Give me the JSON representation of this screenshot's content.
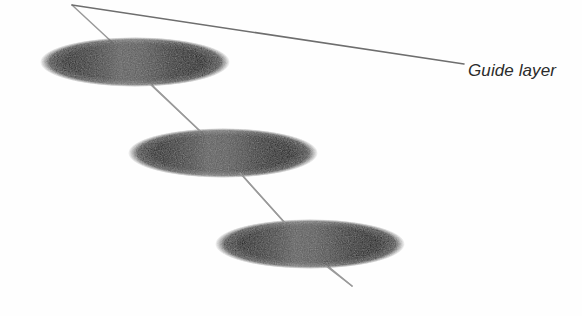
{
  "figure": {
    "title": "",
    "background_color": "#fefefe",
    "width": 582,
    "height": 316,
    "annotation": {
      "label": "Guide layer",
      "text_color": "#2b2b2b",
      "x": 468,
      "y": 62,
      "font_size": 17,
      "font_style": "italic"
    },
    "leader_line": {
      "name": "leader-line",
      "color": "#6e6e6e",
      "width": 1.6,
      "from_x": 72,
      "from_y": 5,
      "to_x": 464,
      "to_y": 64
    },
    "guide_path": {
      "name": "guide-path",
      "color": "#9a9a9a",
      "width": 1.5,
      "points": [
        [
          72,
          5
        ],
        [
          113,
          43
        ],
        [
          155,
          88
        ],
        [
          200,
          131
        ],
        [
          243,
          176
        ],
        [
          285,
          223
        ],
        [
          318,
          258
        ],
        [
          352,
          286
        ]
      ]
    },
    "ellipses": [
      {
        "name": "disc-top",
        "cx": 135,
        "cy": 62,
        "rx": 95,
        "ry": 25,
        "edge_color": "#0a0a0a",
        "center_color": "#5c5c5c",
        "highlight_stop": 0.42
      },
      {
        "name": "disc-middle",
        "cx": 223,
        "cy": 153,
        "rx": 95,
        "ry": 25,
        "edge_color": "#0a0a0a",
        "center_color": "#5c5c5c",
        "highlight_stop": 0.42
      },
      {
        "name": "disc-bottom",
        "cx": 310,
        "cy": 244,
        "rx": 95,
        "ry": 25,
        "edge_color": "#0a0a0a",
        "center_color": "#5c5c5c",
        "highlight_stop": 0.42
      }
    ]
  }
}
